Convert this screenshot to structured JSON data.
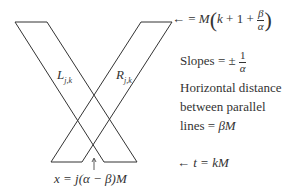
{
  "diagram": {
    "labels": {
      "left_band": "L",
      "left_band_sub": "j,k",
      "right_band": "R",
      "right_band_sub": "j,k",
      "top_arrow": "← =",
      "top_M": "M",
      "top_k": "k",
      "top_plus1": "+ 1 +",
      "top_beta": "β",
      "top_alpha": "α",
      "slopes_text": "Slopes = ±",
      "slopes_num": "1",
      "slopes_den": "α",
      "horiz1": "Horizontal distance",
      "horiz2": "between parallel",
      "horiz3_text": "lines = ",
      "horiz3_math": "βM",
      "bottom_arrow": "←",
      "bottom_eq": "t = kM",
      "x_eq": "x = j(α − β)M"
    },
    "geometry": {
      "top_y": 22,
      "bottom_y": 162,
      "left_band": {
        "top": [
          15,
          47
        ],
        "bottom": [
          104,
          137
        ]
      },
      "right_band": {
        "top": [
          141,
          172
        ],
        "bottom": [
          51,
          82
        ]
      },
      "arrow_x": 94
    },
    "colors": {
      "line": "#333333",
      "background": "#ffffff"
    }
  }
}
